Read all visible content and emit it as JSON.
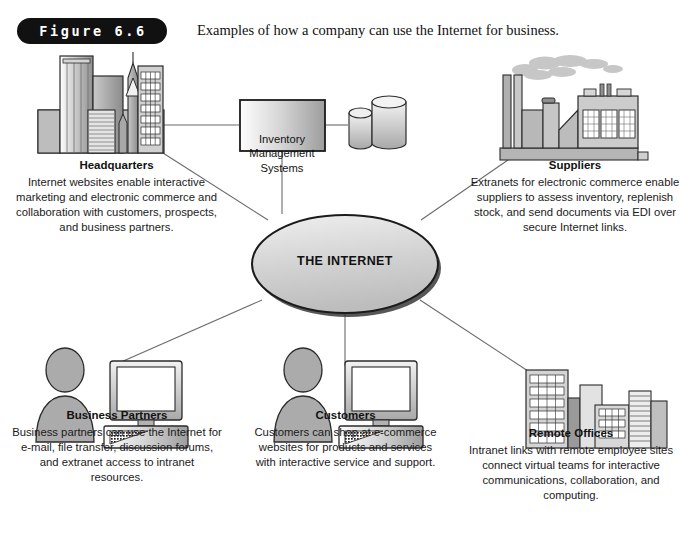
{
  "figure": {
    "badge_label": "Figure 6.6",
    "caption": "Examples of how a company can use the Internet for business."
  },
  "center": {
    "label": "THE INTERNET"
  },
  "system_box": {
    "line1": "Inventory",
    "line2": "Management",
    "line3": "Systems",
    "icon": "database-cylinder"
  },
  "nodes": {
    "headquarters": {
      "title": "Headquarters",
      "icon": "city-skyline-icon",
      "desc": "Internet websites enable interactive marketing and electronic commerce and collaboration with customers, prospects, and business partners."
    },
    "suppliers": {
      "title": "Suppliers",
      "icon": "factory-icon",
      "desc": "Extranets for electronic commerce enable suppliers to assess inventory, replenish stock, and send documents via EDI over secure Internet links."
    },
    "business_partners": {
      "title": "Business Partners",
      "icon": "person-computer-icon",
      "desc": "Business partners can use the Internet for e-mail, file transfer, discussion forums, and extranet access to intranet resources."
    },
    "customers": {
      "title": "Customers",
      "icon": "person-computer-icon",
      "desc": "Customers can shop at e-commerce websites for products and services with interactive service and support."
    },
    "remote_offices": {
      "title": "Remote Offices",
      "icon": "office-buildings-icon",
      "desc": "Intranet links with remote employee sites connect virtual teams for interactive communications, collaboration, and computing."
    }
  },
  "colors": {
    "badge_background": "#111111",
    "badge_text": "#ffffff",
    "line": "#6b6b6b",
    "shape_fill_light": "#e8e8e8",
    "shape_fill_mid": "#b9b9b9",
    "shape_fill_dark": "#8f8f8f",
    "outline": "#2b2b2b",
    "text": "#1a1a1a"
  }
}
